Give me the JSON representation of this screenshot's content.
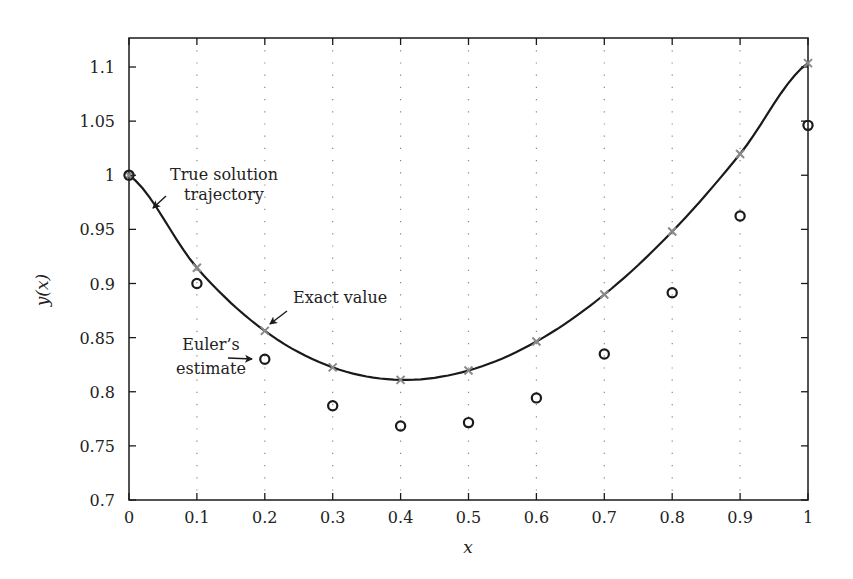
{
  "chart_data": {
    "type": "line",
    "title": "",
    "xlabel": "x",
    "ylabel": "y(x)",
    "xlim": [
      0,
      1
    ],
    "ylim": [
      0.7,
      1.125
    ],
    "grid": "vertical dotted lines at x ticks",
    "legend": "none (inline annotations)",
    "x_ticks": [
      "0",
      "0.1",
      "0.2",
      "0.3",
      "0.4",
      "0.5",
      "0.6",
      "0.7",
      "0.8",
      "0.9",
      "1"
    ],
    "y_ticks": [
      "0.7",
      "0.75",
      "0.8",
      "0.85",
      "0.9",
      "0.95",
      "1",
      "1.05",
      "1.1"
    ],
    "x": [
      0,
      0.1,
      0.2,
      0.3,
      0.4,
      0.5,
      0.6,
      0.7,
      0.8,
      0.9,
      1.0
    ],
    "series": [
      {
        "name": "True solution trajectory",
        "style": "solid black line",
        "values": [
          1.0,
          0.9145,
          0.8562,
          0.8225,
          0.811,
          0.8196,
          0.8464,
          0.8898,
          0.948,
          1.0197,
          1.1036
        ]
      },
      {
        "name": "Exact value",
        "style": "gray x markers",
        "values": [
          1.0,
          0.9145,
          0.8562,
          0.8225,
          0.811,
          0.8196,
          0.8464,
          0.8898,
          0.948,
          1.0197,
          1.1036
        ]
      },
      {
        "name": "Euler's estimate",
        "style": "black open circles",
        "values": [
          1.0,
          0.9,
          0.83,
          0.787,
          0.7683,
          0.7715,
          0.7943,
          0.8349,
          0.8914,
          0.9623,
          1.0461
        ]
      }
    ],
    "annotations": [
      {
        "text_lines": [
          "True solution",
          "trajectory"
        ],
        "points_to": "curve near x=0.03"
      },
      {
        "text_lines": [
          "Exact value"
        ],
        "points_to": "marker at x=0.2"
      },
      {
        "text_lines": [
          "Euler’s",
          "estimate"
        ],
        "points_to": "circle at x=0.2"
      }
    ]
  },
  "labels": {
    "xlabel": "x",
    "ylabel": "y(x)",
    "annot_true_1": "True solution",
    "annot_true_2": "trajectory",
    "annot_exact": "Exact value",
    "annot_euler_1": "Euler’s",
    "annot_euler_2": "estimate"
  },
  "colors": {
    "curve": "#1a1a1a",
    "exact_marker": "#8a8a8a",
    "euler_marker": "#1a1a1a",
    "grid": "#888888"
  }
}
